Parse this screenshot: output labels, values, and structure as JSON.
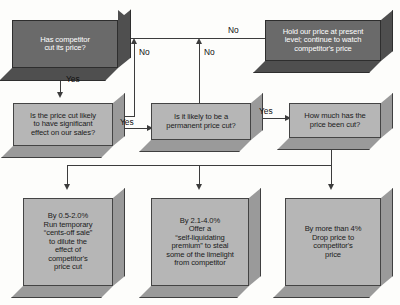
{
  "diagram": {
    "background_color": "#fdfdfb",
    "dark_box_color": "#6a6a6a",
    "light_box_color": "#b6b6b6",
    "line_color": "#3c3c3c"
  },
  "nodes": {
    "start": {
      "id": "has-competitor-cut-price",
      "text": "Has competitor\ncut its price?",
      "style": "dark",
      "font_size": "7.6px"
    },
    "hold_price": {
      "id": "hold-our-price",
      "text": "Hold our price at present\nlevel; continue to watch\ncompetitor's price",
      "style": "dark",
      "font_size": "7.6px"
    },
    "significant_effect": {
      "id": "is-price-cut-likely-significant",
      "text": "Is the price cut likely\nto have significant\neffect on our sales?",
      "style": "light",
      "font_size": "7.6px"
    },
    "permanent_cut": {
      "id": "is-it-likely-permanent",
      "text": "Is it likely to be a\npermanent price cut?",
      "style": "light",
      "font_size": "7.6px"
    },
    "how_much": {
      "id": "how-much-has-price-been-cut",
      "text": "How much has the\nprice been cut?",
      "style": "light",
      "font_size": "7.6px"
    },
    "outcome_low": {
      "id": "outcome-0-5-to-2-0",
      "text": "By 0.5-2.0%\nRun temporary\n“cents-off sale”\nto dilute the\neffect of\ncompetitor's\nprice cut",
      "style": "light",
      "font_size": "7.6px"
    },
    "outcome_mid": {
      "id": "outcome-2-1-to-4-0",
      "text": "By 2.1-4.0%\nOffer a\n“self-liquidating\npremium” to steal\nsome of the limelight\nfrom competitor",
      "style": "light",
      "font_size": "7.6px"
    },
    "outcome_high": {
      "id": "outcome-more-than-4",
      "text": "By more than 4%\nDrop price to\ncompetitor's\nprice",
      "style": "light",
      "font_size": "7.6px"
    }
  },
  "edge_labels": {
    "start_no": "No",
    "start_yes": "Yes",
    "significant_no": "No",
    "significant_yes": "Yes",
    "permanent_no": "No",
    "permanent_yes": "Yes"
  }
}
